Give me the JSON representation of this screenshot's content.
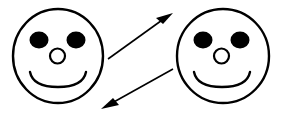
{
  "scene": {
    "title": "Two smiley faces connected by a pair of opposing arrows",
    "width": 284,
    "height": 116,
    "background_color": "#ffffff",
    "ink_color": "#000000",
    "style": "black line drawing on white background"
  },
  "faces": [
    {
      "id": "left-face",
      "label": "left smiley face",
      "expression": "smiling",
      "head": {
        "cx": 58,
        "cy": 56,
        "rx": 45,
        "ry": 47,
        "stroke_width": 2.4,
        "fill": "#ffffff",
        "stroke": "#000000"
      },
      "eyes": [
        {
          "id": "left-face-left-eye",
          "cx": 39,
          "cy": 40,
          "rx": 9.5,
          "ry": 8.5,
          "fill": "#000000"
        },
        {
          "id": "left-face-right-eye",
          "cx": 76,
          "cy": 40,
          "rx": 9.5,
          "ry": 8.5,
          "fill": "#000000"
        }
      ],
      "nose": {
        "id": "left-face-nose",
        "cx": 57.5,
        "cy": 56,
        "rx": 7.5,
        "ry": 7.5,
        "fill": "#ffffff",
        "stroke": "#000000",
        "stroke_width": 2.2
      },
      "mouth": {
        "id": "left-face-mouth",
        "path": "M 30 72 Q 33 87 58 87 Q 83 87 86 72",
        "stroke": "#000000",
        "stroke_width": 2.4
      }
    },
    {
      "id": "right-face",
      "label": "right smiley face",
      "expression": "smiling",
      "head": {
        "cx": 223,
        "cy": 56,
        "rx": 46,
        "ry": 47,
        "stroke_width": 2.4,
        "fill": "#ffffff",
        "stroke": "#000000"
      },
      "eyes": [
        {
          "id": "right-face-left-eye",
          "cx": 203,
          "cy": 40,
          "rx": 9.5,
          "ry": 8.5,
          "fill": "#000000"
        },
        {
          "id": "right-face-right-eye",
          "cx": 240,
          "cy": 40,
          "rx": 9.5,
          "ry": 8.5,
          "fill": "#000000"
        }
      ],
      "nose": {
        "id": "right-face-nose",
        "cx": 221.5,
        "cy": 56,
        "rx": 7.5,
        "ry": 7.5,
        "fill": "#ffffff",
        "stroke": "#000000",
        "stroke_width": 2.2
      },
      "mouth": {
        "id": "right-face-mouth",
        "path": "M 194 72 Q 197 87 222 87 Q 247 87 250 72",
        "stroke": "#000000",
        "stroke_width": 2.4
      }
    }
  ],
  "arrows": [
    {
      "id": "upper-arrow",
      "label": "upper arrow pointing up-right toward right face",
      "direction": "up-right",
      "from": {
        "x": 108,
        "y": 59
      },
      "to": {
        "x": 173,
        "y": 13
      },
      "shaft_path": "M 108 59 L 165 18",
      "head_path": "M 173 13 L 156 18 L 163 24 Z",
      "stroke": "#000000",
      "stroke_width": 1.6
    },
    {
      "id": "lower-arrow",
      "label": "lower arrow pointing down-left toward left face",
      "direction": "down-left",
      "from": {
        "x": 173,
        "y": 69
      },
      "to": {
        "x": 101,
        "y": 109
      },
      "shaft_path": "M 173 69 L 112 103",
      "head_path": "M 101 109 L 119 105 L 113 98 Z",
      "stroke": "#000000",
      "stroke_width": 1.6
    }
  ]
}
